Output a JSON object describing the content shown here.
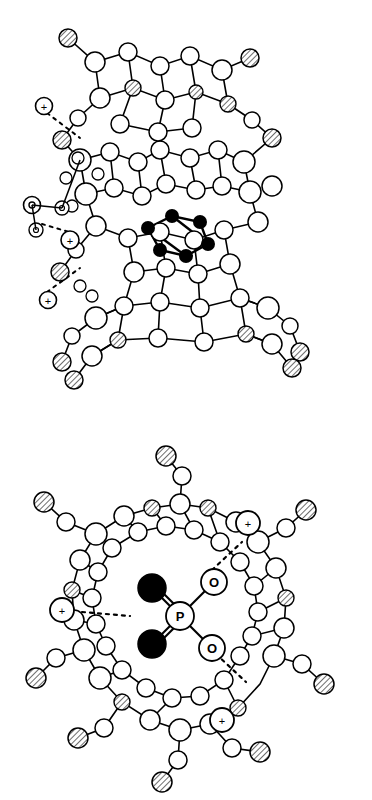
{
  "figure": {
    "panels": [
      {
        "id": "top-panel",
        "name": "side-view",
        "caption": "",
        "charges": [
          "+",
          "+",
          "+"
        ],
        "atom_labels": [],
        "hbond_count": 3
      },
      {
        "id": "bottom-panel",
        "name": "top-view",
        "caption": "",
        "charges": [
          "+",
          "+",
          "+"
        ],
        "atom_labels": [
          "O",
          "O",
          "P",
          "O",
          "O"
        ],
        "hbond_count": 3
      }
    ]
  },
  "legend": {
    "open_circle": "carbon/hydrogen atom (open)",
    "shaded_circle": "nitrogen atom (hatched)",
    "filled_circle": "oxygen atom (filled)",
    "dotted_line": "hydrogen bond"
  },
  "colors": {
    "stroke": "#000000",
    "open_fill": "#ffffff",
    "dark_fill": "#000000",
    "hatch_fill": "#9a9a9a",
    "background": "#ffffff"
  },
  "bottom_panel_labels": {
    "o_top_right": "O",
    "o_left_upper": "O",
    "p_center": "P",
    "o_right_lower": "O",
    "o_bottom": "O"
  },
  "charge_symbol": "+"
}
